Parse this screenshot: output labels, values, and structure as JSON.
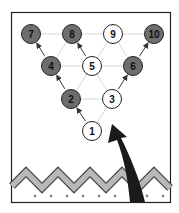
{
  "diagram": {
    "colors": {
      "frame": "#222222",
      "grid_line": "#cfcfcf",
      "pin_dark_fill": "#6e6e6e",
      "pin_light_fill": "#ffffff",
      "pin_stroke": "#222222",
      "label_dark": "#111111",
      "zigzag_fill": "#b8b8b8",
      "zigzag_stroke": "#444444",
      "dots": "#8a8a8a",
      "big_arrow": "#1a1a1a",
      "small_arrow": "#333333"
    },
    "pins": [
      {
        "label": "1",
        "x": 92,
        "y": 131,
        "style": "light"
      },
      {
        "label": "2",
        "x": 71,
        "y": 99,
        "style": "dark"
      },
      {
        "label": "3",
        "x": 112,
        "y": 99,
        "style": "light"
      },
      {
        "label": "4",
        "x": 51,
        "y": 66,
        "style": "dark"
      },
      {
        "label": "5",
        "x": 92,
        "y": 66,
        "style": "light"
      },
      {
        "label": "6",
        "x": 133,
        "y": 66,
        "style": "dark"
      },
      {
        "label": "7",
        "x": 31,
        "y": 34,
        "style": "dark"
      },
      {
        "label": "8",
        "x": 72,
        "y": 34,
        "style": "dark"
      },
      {
        "label": "9",
        "x": 113,
        "y": 34,
        "style": "light"
      },
      {
        "label": "10",
        "x": 154,
        "y": 34,
        "style": "dark"
      }
    ],
    "small_arrows": [
      {
        "from": "1",
        "to": "2"
      },
      {
        "from": "2",
        "to": "4"
      },
      {
        "from": "4",
        "to": "7"
      },
      {
        "from": "5",
        "to": "8"
      },
      {
        "from": "3",
        "to": "6"
      },
      {
        "from": "6",
        "to": "10"
      }
    ],
    "big_arrow": {
      "description": "curved black arrow rising from bottom right toward pin 1/3 area"
    }
  }
}
